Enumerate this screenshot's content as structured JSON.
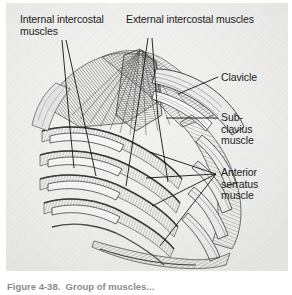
{
  "figure": {
    "kind": "anatomical-illustration",
    "style": "grayscale engraving / hatched line drawing",
    "panel_color": "#f2f2f1",
    "ink_color": "#1a1a1a",
    "labels": [
      {
        "id": "internal-intercostal",
        "text": "Internal intercostal\nmuscles",
        "position": "top-left"
      },
      {
        "id": "external-intercostal",
        "text": "External intercostal muscles",
        "position": "top-center"
      },
      {
        "id": "clavicle",
        "text": "Clavicle",
        "position": "right-upper"
      },
      {
        "id": "subclavius",
        "text": "Sub-\nclavius\nmuscle",
        "position": "right-middle"
      },
      {
        "id": "anterior-serratus",
        "text": "Anterior\nserratus\nmuscle",
        "position": "right-lower"
      }
    ],
    "caption": {
      "text": "Figure 4-38.  Group of muscles...",
      "note": "cropped at bottom edge of image"
    }
  }
}
